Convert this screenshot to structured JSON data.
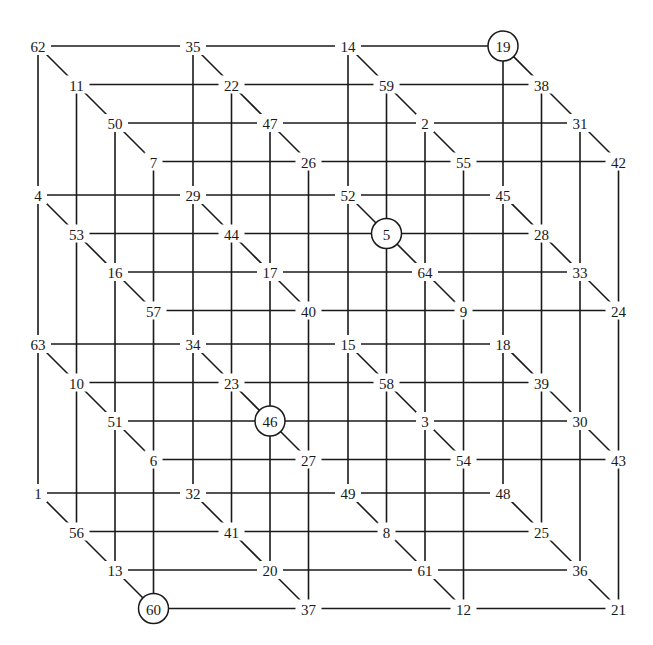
{
  "magic_constant": 130,
  "layout": {
    "origin_x": 38,
    "origin_y": 46,
    "col_dx": 155,
    "level_dy": 149,
    "depth_dx": 38.5,
    "depth_dy": 38.5
  },
  "circled": [
    19,
    5,
    46,
    60
  ],
  "levels": [
    {
      "name": "level-1",
      "rows": [
        [
          62,
          35,
          14,
          19
        ],
        [
          11,
          22,
          59,
          38
        ],
        [
          50,
          47,
          2,
          31
        ],
        [
          7,
          26,
          55,
          42
        ]
      ]
    },
    {
      "name": "level-2",
      "rows": [
        [
          4,
          29,
          52,
          45
        ],
        [
          53,
          44,
          5,
          28
        ],
        [
          16,
          17,
          64,
          33
        ],
        [
          57,
          40,
          9,
          24
        ]
      ]
    },
    {
      "name": "level-3",
      "rows": [
        [
          63,
          34,
          15,
          18
        ],
        [
          10,
          23,
          58,
          39
        ],
        [
          51,
          46,
          3,
          30
        ],
        [
          6,
          27,
          54,
          43
        ]
      ]
    },
    {
      "name": "level-4",
      "rows": [
        [
          1,
          32,
          49,
          48
        ],
        [
          56,
          41,
          8,
          25
        ],
        [
          13,
          20,
          61,
          36
        ],
        [
          60,
          37,
          12,
          21
        ]
      ]
    }
  ]
}
